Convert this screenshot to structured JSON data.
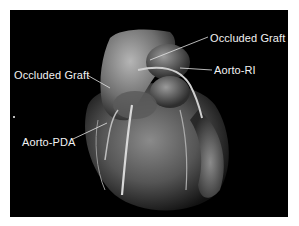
{
  "figure": {
    "background_color": "#000000",
    "label_color": "#f2f2f2",
    "labels": [
      {
        "id": "occluded-graft-top",
        "text": "Occluded Graft"
      },
      {
        "id": "aorto-ri",
        "text": "Aorto-RI"
      },
      {
        "id": "occluded-graft-left",
        "text": "Occluded Graft"
      },
      {
        "id": "aorto-pda",
        "text": "Aorto-PDA"
      }
    ]
  }
}
